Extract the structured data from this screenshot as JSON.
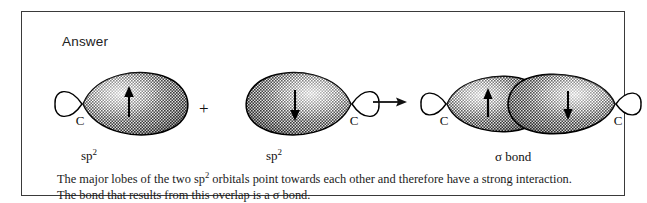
{
  "box": {
    "heading": "Answer",
    "border_color": "#3a3a3a",
    "background_color": "#ffffff"
  },
  "scheme": {
    "plus_operator": "+",
    "arrow_operator": "→",
    "reactants": [
      {
        "id": "orbital-left",
        "atom_label": "C",
        "hybrid_label_text": "sp",
        "hybrid_label_sup": "2",
        "spin": "up",
        "spin_arrow": "↑",
        "major_lobe_direction": "right",
        "minor_lobe_direction": "left"
      },
      {
        "id": "orbital-right",
        "atom_label": "C",
        "hybrid_label_text": "sp",
        "hybrid_label_sup": "2",
        "spin": "down",
        "spin_arrow": "↓",
        "major_lobe_direction": "left",
        "minor_lobe_direction": "right"
      }
    ],
    "product": {
      "id": "sigma-bond-orbital",
      "label": "σ bond",
      "atom_label_left": "C",
      "atom_label_right": "C",
      "spin_left": "up",
      "spin_right": "down",
      "spin_arrow_left": "↑",
      "spin_arrow_right": "↓"
    }
  },
  "caption": {
    "line1_part1": "The major lobes of the two sp",
    "line1_sup": "2",
    "line1_part2": " orbitals point towards each other and therefore have a strong interaction.",
    "line2": "The bond that results from this overlap is a σ bond."
  },
  "colors": {
    "ink": "#111111",
    "lobe_outline": "#000000",
    "lobe_fill_dark": "#6f6f6f",
    "lobe_fill_mid": "#8d8d8d",
    "lobe_fill_light": "#c9c9c9"
  }
}
